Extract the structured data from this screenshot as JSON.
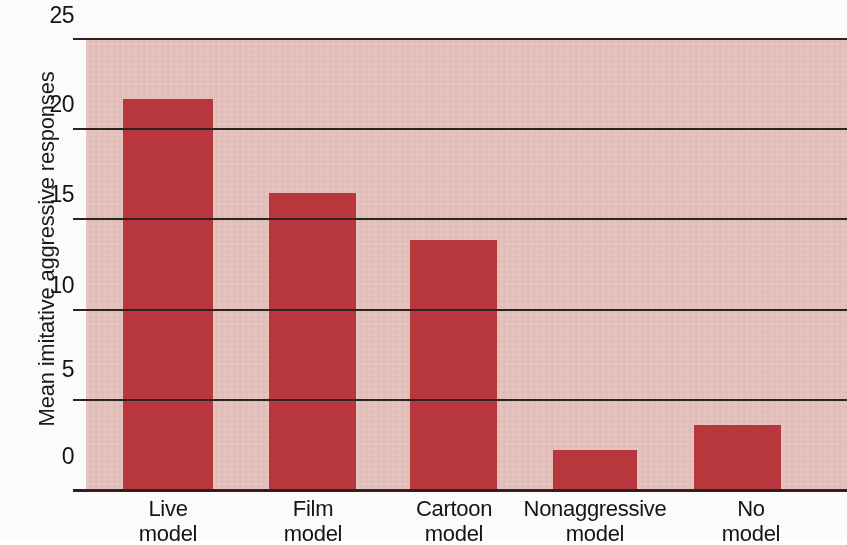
{
  "chart_data": {
    "type": "bar",
    "title": "",
    "xlabel": "",
    "ylabel": "Mean imitative aggressive responses",
    "ylim": [
      0,
      25
    ],
    "ytick_labels": [
      "25",
      "20",
      "15",
      "10",
      "5",
      "0"
    ],
    "yticks": [
      25,
      20,
      15,
      10,
      5,
      0
    ],
    "grid": true,
    "legend": "none",
    "categories": [
      "Live model",
      "Film model",
      "Cartoon model",
      "Nonaggressive model",
      "No model"
    ],
    "category_lines": [
      [
        "Live",
        "model"
      ],
      [
        "Film",
        "model"
      ],
      [
        "Cartoon",
        "model"
      ],
      [
        "Nonaggressive",
        "model"
      ],
      [
        "No",
        "model"
      ]
    ],
    "values": [
      21.6,
      16.4,
      13.8,
      2.2,
      3.6
    ],
    "bar_color": "#b8373c",
    "plot_background": "#e6c2be",
    "axis_color": "#2b2322"
  },
  "axis": {
    "y_title": "Mean imitative aggressive responses"
  }
}
